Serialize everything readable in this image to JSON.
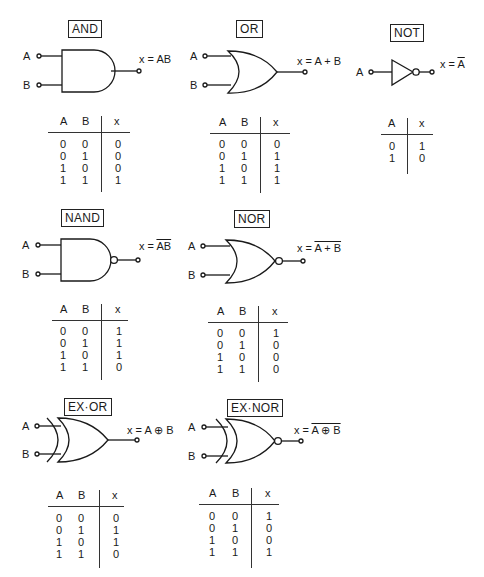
{
  "gates": {
    "and": {
      "title": "AND",
      "in_a": "A",
      "in_b": "B",
      "expr_prefix": "x = ",
      "expr": "AB",
      "expr_overlined": false
    },
    "or": {
      "title": "OR",
      "in_a": "A",
      "in_b": "B",
      "expr_prefix": "x = ",
      "expr": "A + B",
      "expr_overlined": false
    },
    "not": {
      "title": "NOT",
      "in_a": "A",
      "expr_prefix": "x = ",
      "expr": "A",
      "expr_overlined": true
    },
    "nand": {
      "title": "NAND",
      "in_a": "A",
      "in_b": "B",
      "expr_prefix": "x = ",
      "expr": "AB",
      "expr_overlined": true
    },
    "nor": {
      "title": "NOR",
      "in_a": "A",
      "in_b": "B",
      "expr_prefix": "x = ",
      "expr": "A + B",
      "expr_overlined": true
    },
    "exor": {
      "title": "EX·OR",
      "in_a": "A",
      "in_b": "B",
      "expr_prefix": "x = ",
      "expr": "A ⊕ B",
      "expr_overlined": false
    },
    "exnor": {
      "title": "EX·NOR",
      "in_a": "A",
      "in_b": "B",
      "expr_prefix": "x = ",
      "expr": "A ⊕ B",
      "expr_overlined": true
    }
  },
  "tables": {
    "and": {
      "headers": [
        "A",
        "B",
        "x"
      ],
      "rows": [
        [
          "0",
          "0",
          "0"
        ],
        [
          "0",
          "1",
          "0"
        ],
        [
          "1",
          "0",
          "0"
        ],
        [
          "1",
          "1",
          "1"
        ]
      ]
    },
    "or": {
      "headers": [
        "A",
        "B",
        "x"
      ],
      "rows": [
        [
          "0",
          "0",
          "0"
        ],
        [
          "0",
          "1",
          "1"
        ],
        [
          "1",
          "0",
          "1"
        ],
        [
          "1",
          "1",
          "1"
        ]
      ]
    },
    "not": {
      "headers": [
        "A",
        "x"
      ],
      "rows": [
        [
          "0",
          "1"
        ],
        [
          "1",
          "0"
        ]
      ]
    },
    "nand": {
      "headers": [
        "A",
        "B",
        "x"
      ],
      "rows": [
        [
          "0",
          "0",
          "1"
        ],
        [
          "0",
          "1",
          "1"
        ],
        [
          "1",
          "0",
          "1"
        ],
        [
          "1",
          "1",
          "0"
        ]
      ]
    },
    "nor": {
      "headers": [
        "A",
        "B",
        "x"
      ],
      "rows": [
        [
          "0",
          "0",
          "1"
        ],
        [
          "0",
          "1",
          "0"
        ],
        [
          "1",
          "0",
          "0"
        ],
        [
          "1",
          "1",
          "0"
        ]
      ]
    },
    "exor": {
      "headers": [
        "A",
        "B",
        "x"
      ],
      "rows": [
        [
          "0",
          "0",
          "0"
        ],
        [
          "0",
          "1",
          "1"
        ],
        [
          "1",
          "0",
          "1"
        ],
        [
          "1",
          "1",
          "0"
        ]
      ]
    },
    "exnor": {
      "headers": [
        "A",
        "B",
        "x"
      ],
      "rows": [
        [
          "0",
          "0",
          "1"
        ],
        [
          "0",
          "1",
          "0"
        ],
        [
          "1",
          "0",
          "0"
        ],
        [
          "1",
          "1",
          "1"
        ]
      ]
    }
  }
}
